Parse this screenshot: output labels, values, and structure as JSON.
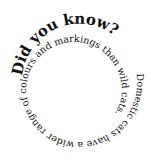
{
  "figure": {
    "heading": "Did you know?",
    "body": "Domestic cats have a wider range of colours and markings than wild cats.",
    "full_text": "Did you know? Domestic cats have a wider range of colours and markings than wild cats.",
    "layout": "clockwise inward spiral",
    "text_color": "#111111",
    "background_color": "#ffffff"
  }
}
